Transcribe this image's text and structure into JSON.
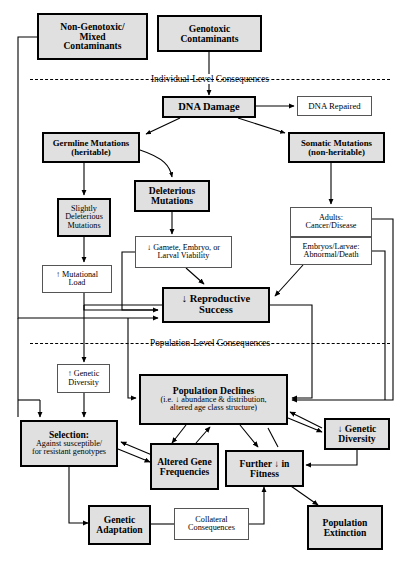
{
  "diagram": {
    "dividers": [
      {
        "label": "Individual-Level Consequences"
      },
      {
        "label": "Population-Level Consequences"
      }
    ],
    "nodes": {
      "non_genotoxic": {
        "line1": "Non-Genotoxic/",
        "line2": "Mixed",
        "line3": "Contaminants"
      },
      "genotoxic": {
        "line1": "Genotoxic",
        "line2": "Contaminants"
      },
      "dna_damage": {
        "line1": "DNA Damage"
      },
      "dna_repaired": {
        "line1": "DNA Repaired"
      },
      "germline": {
        "line1": "Germline Mutations",
        "line2": "(heritable)"
      },
      "somatic": {
        "line1": "Somatic Mutations",
        "line2": "(non-heritable)"
      },
      "deleterious": {
        "line1": "Deleterious",
        "line2": "Mutations"
      },
      "slightly_deleterious": {
        "line1": "Slightly",
        "line2": "Deleterious",
        "line3": "Mutations"
      },
      "gamete": {
        "line1": "↓ Gamete, Embryo, or",
        "line2": "Larval Viability"
      },
      "adults": {
        "line1": "Adults:",
        "line2": "Cancer/Disease"
      },
      "embryos": {
        "line1": "Embryos/Larvae:",
        "line2": "Abnormal/Death"
      },
      "mutational_load": {
        "line1": "↑ Mutational",
        "line2": "Load"
      },
      "reproductive_success": {
        "line1": "↓ Reproductive",
        "line2": "Success"
      },
      "genetic_diversity_up": {
        "line1": "↑ Genetic",
        "line2": "Diversity"
      },
      "population_declines": {
        "line1": "Population Declines",
        "line2": "(i.e. ↓ abundance & distribution,",
        "line3": "altered age class structure)"
      },
      "genetic_diversity_down": {
        "line1": "↓ Genetic",
        "line2": "Diversity"
      },
      "selection": {
        "line1": "Selection:",
        "line2": "Against susceptible/",
        "line3": "for resistant genotypes"
      },
      "altered_gene_frequencies": {
        "line1": "Altered Gene",
        "line2": "Frequencies"
      },
      "further_fitness": {
        "line1": "Further ↓ in",
        "line2": "Fitness"
      },
      "genetic_adaptation": {
        "line1": "Genetic",
        "line2": "Adaptation"
      },
      "collateral": {
        "line1": "Collateral",
        "line2": "Consequences"
      },
      "population_extinction": {
        "line1": "Population",
        "line2": "Extinction"
      }
    },
    "colors": {
      "shade": "#e0e0e0",
      "stroke_heavy": "#000000",
      "stroke_light": "#555555",
      "background": "#ffffff"
    }
  }
}
